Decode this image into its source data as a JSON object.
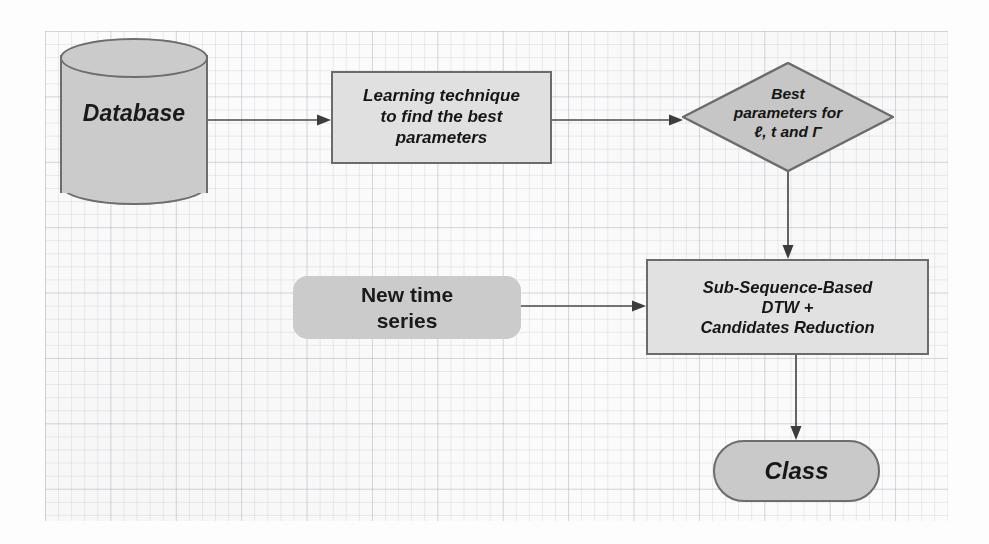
{
  "diagram": {
    "background": {
      "paper": "graph-paper",
      "grid_minor_color": "#8a97a8",
      "grid_major_color": "#7887a0"
    },
    "palette": {
      "node_fill_dark": "#cbcbcb",
      "node_fill_light": "#e0e0e0",
      "node_stroke": "#6b6b6b",
      "connector": "#4a4a4a",
      "text": "#161616"
    },
    "nodes": [
      {
        "id": "database",
        "shape": "cylinder",
        "label": "Database",
        "style": "italic-bold"
      },
      {
        "id": "learning",
        "shape": "rectangle",
        "label": "Learning  technique\nto find the best\nparameters",
        "style": "italic-bold"
      },
      {
        "id": "decision",
        "shape": "diamond",
        "label": "Best\nparameters for\nℓ, t and Γ",
        "style": "italic-bold"
      },
      {
        "id": "new-series",
        "shape": "rounded-rectangle",
        "label": "New time\nseries",
        "style": "bold"
      },
      {
        "id": "dtw",
        "shape": "rectangle",
        "label": "Sub-Sequence-Based\nDTW +\nCandidates Reduction",
        "style": "italic-bold"
      },
      {
        "id": "class",
        "shape": "stadium",
        "label": "Class",
        "style": "italic-bold"
      }
    ],
    "connectors": [
      {
        "id": "database-to-learning",
        "from": "database",
        "to": "learning",
        "direction": "right"
      },
      {
        "id": "learning-to-decision",
        "from": "learning",
        "to": "decision",
        "direction": "right"
      },
      {
        "id": "decision-to-dtw",
        "from": "decision",
        "to": "dtw",
        "direction": "down"
      },
      {
        "id": "new-series-to-dtw",
        "from": "new-series",
        "to": "dtw",
        "direction": "right"
      },
      {
        "id": "dtw-to-class",
        "from": "dtw",
        "to": "class",
        "direction": "down"
      }
    ]
  }
}
